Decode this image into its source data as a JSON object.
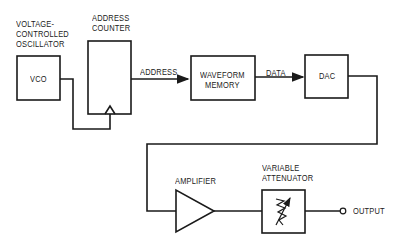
{
  "diagram": {
    "type": "block-diagram",
    "blocks": [
      {
        "id": "vco",
        "label": "VCO",
        "caption": "VOLTAGE-\nCONTROLLED\nOSCILLATOR"
      },
      {
        "id": "address_counter",
        "label": "",
        "caption": "ADDRESS\nCOUNTER"
      },
      {
        "id": "waveform_memory",
        "label": "WAVEFORM\nMEMORY"
      },
      {
        "id": "dac",
        "label": "DAC"
      },
      {
        "id": "amplifier",
        "label": "",
        "caption": "AMPLIFIER"
      },
      {
        "id": "variable_attenuator",
        "label": "",
        "caption": "VARIABLE\nATTENUATOR"
      }
    ],
    "signals": {
      "address": "ADDRESS",
      "data": "DATA",
      "output": "OUTPUT"
    },
    "connections": [
      {
        "from": "vco",
        "to": "address_counter",
        "note": "clock input"
      },
      {
        "from": "address_counter",
        "to": "waveform_memory",
        "label": "ADDRESS"
      },
      {
        "from": "waveform_memory",
        "to": "dac",
        "label": "DATA"
      },
      {
        "from": "dac",
        "to": "amplifier"
      },
      {
        "from": "amplifier",
        "to": "variable_attenuator"
      },
      {
        "from": "variable_attenuator",
        "to": "output",
        "label": "OUTPUT"
      }
    ]
  },
  "colors": {
    "line": "#1a1a1a",
    "background": "#ffffff"
  }
}
